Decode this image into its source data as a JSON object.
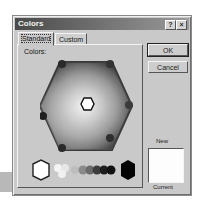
{
  "dialog": {
    "title": "Colors",
    "help_button": "?",
    "close_button": "×"
  },
  "tabs": [
    {
      "label": "Standard",
      "active": true
    },
    {
      "label": "Custom",
      "active": false
    }
  ],
  "panel": {
    "colors_label": "Colors:",
    "selected_color": "#ffffff"
  },
  "buttons": {
    "ok": "OK",
    "cancel": "Cancel"
  },
  "preview": {
    "new_label": "New",
    "current_label": "Current",
    "new_color": "#ffffff",
    "current_color": "#ffffff"
  },
  "greyscale_swatches": [
    "#ffffff",
    "#f2f2f2",
    "#d9d9d9",
    "#bfbfbf",
    "#a6a6a6",
    "#8c8c8c",
    "#737373",
    "#595959",
    "#404040",
    "#262626",
    "#141414",
    "#000000"
  ]
}
